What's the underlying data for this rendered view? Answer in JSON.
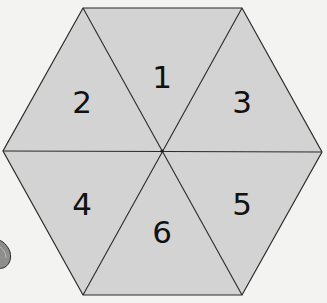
{
  "diagram": {
    "shape": "hexagon",
    "type": "spinner",
    "fill_color": "#d3d3d3",
    "line_color": "#2a2a2a",
    "background_color": "#f3f3f1",
    "center": [
      162,
      151
    ],
    "vertices": [
      [
        83,
        8
      ],
      [
        242,
        8
      ],
      [
        322,
        152
      ],
      [
        242,
        295
      ],
      [
        83,
        295
      ],
      [
        3,
        151
      ]
    ],
    "sections": [
      {
        "label": "1",
        "x": 162,
        "y": 88
      },
      {
        "label": "2",
        "x": 82,
        "y": 113
      },
      {
        "label": "3",
        "x": 242,
        "y": 113
      },
      {
        "label": "4",
        "x": 82,
        "y": 215
      },
      {
        "label": "5",
        "x": 242,
        "y": 215
      },
      {
        "label": "6",
        "x": 162,
        "y": 243
      }
    ]
  },
  "decoration": {
    "partial_object": "gray-pebble",
    "color": "#8a8a8a"
  }
}
